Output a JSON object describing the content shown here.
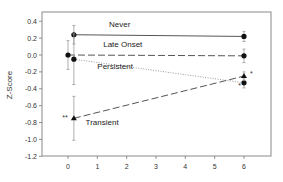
{
  "chart_data": {
    "type": "line",
    "title": "",
    "xlabel": "",
    "ylabel": "Z-Score",
    "xlim": [
      -0.9,
      7.0
    ],
    "ylim": [
      -1.2,
      0.47
    ],
    "x_ticks": [
      0,
      1,
      2,
      3,
      4,
      5,
      6
    ],
    "x_tick_labels": [
      "0",
      "1",
      "2",
      "3",
      "4",
      "5",
      "6"
    ],
    "y_ticks": [
      0.4,
      0.2,
      0.0,
      -0.2,
      -0.4,
      -0.6,
      -0.8,
      -1.0,
      -1.2
    ],
    "y_tick_labels": [
      "0.4",
      "0.2",
      "0.0",
      "-0.2",
      "-0.4",
      "-0.6",
      "-0.8",
      "-1.0",
      "-1.2"
    ],
    "grid": false,
    "legend": "inline labels",
    "series": [
      {
        "name": "Never",
        "line_style": "solid",
        "marker": "circle",
        "x": [
          0.2,
          6
        ],
        "values": [
          0.24,
          0.22
        ],
        "error": [
          0.11,
          0.06
        ],
        "label_pos": {
          "x": 1.4,
          "y": 0.33
        }
      },
      {
        "name": "Late Onset",
        "line_style": "dashed",
        "marker": "circle",
        "x": [
          0,
          6
        ],
        "values": [
          0.0,
          -0.01
        ],
        "error": [
          0.17,
          0.08
        ],
        "label_pos": {
          "x": 1.2,
          "y": 0.1
        }
      },
      {
        "name": "Persistent",
        "line_style": "dotted",
        "marker": "circle",
        "x": [
          0.2,
          6
        ],
        "values": [
          -0.05,
          -0.33
        ],
        "error": [
          0.3,
          0.06
        ],
        "label_pos": {
          "x": 1.0,
          "y": -0.17
        }
      },
      {
        "name": "Transient",
        "line_style": "dashed",
        "marker": "triangle",
        "x": [
          0.2,
          6
        ],
        "values": [
          -0.75,
          -0.25
        ],
        "error": [
          0.26,
          0.05
        ],
        "label_pos": {
          "x": 0.6,
          "y": -0.83
        }
      }
    ],
    "annotations": [
      {
        "text": "**",
        "x": -0.1,
        "y": -0.75
      },
      {
        "text": "*",
        "x": 6.25,
        "y": -0.23
      },
      {
        "text": "*",
        "x": 5.85,
        "y": -0.37
      }
    ]
  }
}
